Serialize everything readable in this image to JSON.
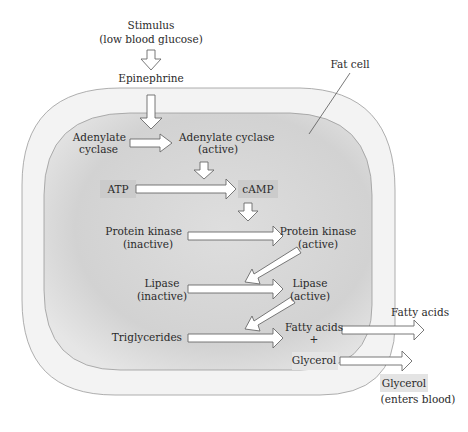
{
  "diagram": {
    "stimulus": {
      "line1": "Stimulus",
      "line2": "(low blood glucose)"
    },
    "hormone": "Epinephrine",
    "cell_label": "Fat cell",
    "nodes": {
      "adenylate_cyclase_inactive": {
        "line1": "Adenylate",
        "line2": "cyclase"
      },
      "adenylate_cyclase_active": {
        "line1": "Adenylate cyclase",
        "line2": "(active)"
      },
      "atp": "ATP",
      "camp": "cAMP",
      "protein_kinase_inactive": {
        "line1": "Protein kinase",
        "line2": "(inactive)"
      },
      "protein_kinase_active": {
        "line1": "Protein kinase",
        "line2": "(active)"
      },
      "lipase_inactive": {
        "line1": "Lipase",
        "line2": "(inactive)"
      },
      "lipase_active": {
        "line1": "Lipase",
        "line2": "(active)"
      },
      "triglycerides": "Triglycerides",
      "fatty_acids_inside": "Fatty acids",
      "plus": "+",
      "glycerol_inside": "Glycerol"
    },
    "outputs": {
      "fatty_acids": "Fatty acids",
      "glycerol": "Glycerol",
      "glycerol_note": "(enters blood)"
    },
    "colors": {
      "outer_membrane": "#f2f2f2",
      "cytoplasm": "#d6d6d6",
      "highlight_box": "#cfcfcf",
      "outline": "#8a8a8a"
    }
  }
}
